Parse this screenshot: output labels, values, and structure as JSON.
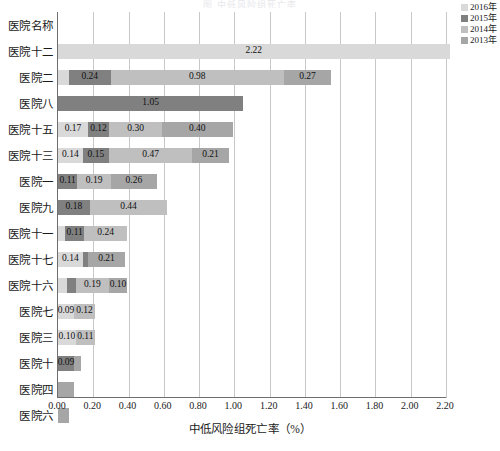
{
  "title": "图    中低风险组死亡率",
  "legend": {
    "position": "top-right",
    "entries": [
      {
        "label": "2016年",
        "color": "#d9d9d9"
      },
      {
        "label": "2015年",
        "color": "#808080"
      },
      {
        "label": "2014年",
        "color": "#bfbfbf"
      },
      {
        "label": "2013年",
        "color": "#a6a6a6"
      }
    ]
  },
  "axis": {
    "y_header": "医院名称",
    "x_title": "中低风险组死亡率（%）",
    "x_ticks": [
      "0.00",
      "0.20",
      "0.40",
      "0.60",
      "0.80",
      "1.00",
      "1.20",
      "1.40",
      "1.60",
      "1.80",
      "2.00",
      "2.20"
    ]
  },
  "chart_data": {
    "type": "bar",
    "orientation": "horizontal",
    "stacked": true,
    "title": "图    中低风险组死亡率",
    "xlabel": "中低风险组死亡率（%）",
    "ylabel": "医院名称",
    "xlim": [
      0,
      2.2
    ],
    "grid": true,
    "legend_position": "top-right",
    "categories": [
      "医院十二",
      "医院二",
      "医院八",
      "医院十五",
      "医院十三",
      "医院一",
      "医院九",
      "医院十一",
      "医院十七",
      "医院十六",
      "医院七",
      "医院三",
      "医院十",
      "医院四",
      "医院六"
    ],
    "series": [
      {
        "name": "2016年",
        "color": "#d9d9d9",
        "values": [
          2.22,
          0.06,
          0.0,
          0.17,
          0.14,
          0.0,
          0.0,
          0.04,
          0.14,
          0.05,
          0.09,
          0.1,
          0.0,
          0.0,
          0.0
        ]
      },
      {
        "name": "2015年",
        "color": "#808080",
        "values": [
          0.0,
          0.24,
          1.05,
          0.12,
          0.15,
          0.11,
          0.18,
          0.11,
          0.03,
          0.05,
          0.0,
          0.0,
          0.09,
          0.0,
          0.0
        ]
      },
      {
        "name": "2014年",
        "color": "#bfbfbf",
        "values": [
          0.0,
          0.98,
          0.0,
          0.3,
          0.47,
          0.19,
          0.44,
          0.24,
          0.0,
          0.19,
          0.12,
          0.11,
          0.0,
          0.0,
          0.0
        ]
      },
      {
        "name": "2013年",
        "color": "#a6a6a6",
        "values": [
          0.0,
          0.27,
          0.0,
          0.4,
          0.21,
          0.26,
          0.0,
          0.0,
          0.21,
          0.1,
          0.0,
          0.0,
          0.04,
          0.09,
          0.06
        ]
      }
    ],
    "bar_labels": [
      [
        {
          "text": "2.22",
          "series": "2016年"
        }
      ],
      [
        {
          "text": "0.24",
          "series": "2015年"
        },
        {
          "text": "0.98",
          "series": "2014年"
        },
        {
          "text": "0.27",
          "series": "2013年"
        }
      ],
      [
        {
          "text": "1.05",
          "series": "2015年"
        }
      ],
      [
        {
          "text": "0.17",
          "series": "2016年"
        },
        {
          "text": "0.12",
          "series": "2015年"
        },
        {
          "text": "0.30",
          "series": "2014年"
        },
        {
          "text": "0.40",
          "series": "2013年"
        }
      ],
      [
        {
          "text": "0.14",
          "series": "2016年"
        },
        {
          "text": "0.15",
          "series": "2015年"
        },
        {
          "text": "0.47",
          "series": "2014年"
        },
        {
          "text": "0.21",
          "series": "2013年"
        }
      ],
      [
        {
          "text": "0.11",
          "series": "2015年"
        },
        {
          "text": "0.19",
          "series": "2014年"
        },
        {
          "text": "0.26",
          "series": "2013年"
        }
      ],
      [
        {
          "text": "0.18",
          "series": "2015年"
        },
        {
          "text": "0.44",
          "series": "2014年"
        }
      ],
      [
        {
          "text": "0.11",
          "series": "2015年"
        },
        {
          "text": "0.24",
          "series": "2014年"
        }
      ],
      [
        {
          "text": "0.14",
          "series": "2016年"
        },
        {
          "text": "0.21",
          "series": "2013年"
        }
      ],
      [
        {
          "text": "0.19",
          "series": "2014年"
        },
        {
          "text": "0.10",
          "series": "2013年"
        }
      ],
      [
        {
          "text": "0.09",
          "series": "2016年"
        },
        {
          "text": "0.12",
          "series": "2014年"
        }
      ],
      [
        {
          "text": "0.10",
          "series": "2016年"
        },
        {
          "text": "0.11",
          "series": "2014年"
        }
      ],
      [
        {
          "text": "0.09",
          "series": "2015年"
        }
      ],
      [],
      []
    ]
  }
}
